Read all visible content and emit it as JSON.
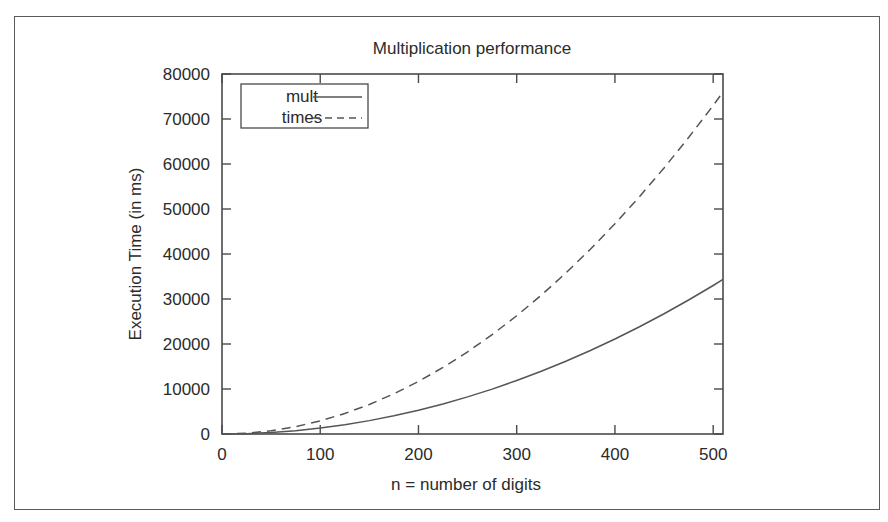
{
  "chart_data": {
    "type": "line",
    "title": "Multiplication performance",
    "xlabel": "n = number of digits",
    "ylabel": "Execution Time (in ms)",
    "xlim": [
      0,
      510
    ],
    "ylim": [
      0,
      80000
    ],
    "xticks": [
      0,
      100,
      200,
      300,
      400,
      500
    ],
    "yticks": [
      0,
      10000,
      20000,
      30000,
      40000,
      50000,
      60000,
      70000,
      80000
    ],
    "xtick_labels": [
      "0",
      "100",
      "200",
      "300",
      "400",
      "500"
    ],
    "ytick_labels": [
      "0",
      "10000",
      "20000",
      "30000",
      "40000",
      "50000",
      "60000",
      "70000",
      "80000"
    ],
    "grid": false,
    "legend_position": "upper left inside",
    "x": [
      0,
      25,
      50,
      75,
      100,
      125,
      150,
      175,
      200,
      225,
      250,
      275,
      300,
      325,
      350,
      375,
      400,
      425,
      450,
      475,
      500,
      510
    ],
    "series": [
      {
        "name": "mult",
        "style": "solid",
        "color": "#555555",
        "values": [
          0,
          80,
          330,
          740,
          1320,
          2060,
          2970,
          4040,
          5280,
          6680,
          8250,
          9980,
          11880,
          13940,
          16170,
          18560,
          21120,
          23840,
          26730,
          29780,
          33000,
          34340
        ]
      },
      {
        "name": "times",
        "style": "dashed",
        "color": "#555555",
        "values": [
          0,
          180,
          730,
          1640,
          2920,
          4560,
          6570,
          8940,
          11680,
          14790,
          18250,
          22090,
          26280,
          30850,
          35770,
          41060,
          46720,
          52740,
          59130,
          65890,
          73000,
          75970
        ]
      }
    ]
  },
  "legend": {
    "entries": [
      {
        "label": "mult",
        "style": "solid"
      },
      {
        "label": "times",
        "style": "dashed"
      }
    ]
  }
}
